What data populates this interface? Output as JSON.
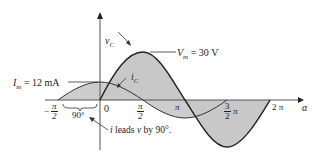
{
  "diagram": {
    "type": "phase-waveform",
    "vertical_axis_label": "v",
    "vertical_axis_sub": "C",
    "current_label": "i",
    "current_sub": "C",
    "horizontal_axis_label": "α",
    "voltage_peak_label": "V",
    "voltage_peak_sub": "m",
    "voltage_peak_value": "= 30 V",
    "current_peak_label": "I",
    "current_peak_sub": "m",
    "current_peak_value": "= 12 mA",
    "ticks": {
      "neg_half_pi": {
        "sign": "−",
        "num": "π",
        "den": "2"
      },
      "zero": "0",
      "half_pi": {
        "num": "π",
        "den": "2"
      },
      "pi": "π",
      "three_half_pi": {
        "num": "3",
        "den": "2",
        "suffix": "π"
      },
      "two_pi": "2 π"
    },
    "phase_gap": "90°",
    "annotation": "i leads v by 90°.",
    "annotation_i": "i",
    "annotation_mid": " leads ",
    "annotation_v": "v",
    "annotation_end": " by 90°.",
    "colors": {
      "fill": "#c8c8c8",
      "stroke": "#222222"
    }
  }
}
